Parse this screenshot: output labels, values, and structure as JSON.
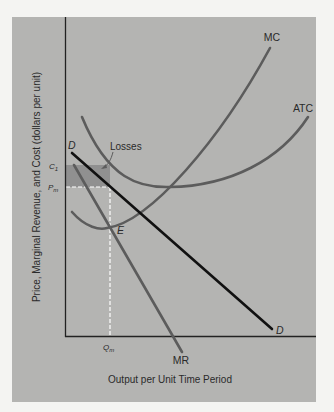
{
  "figure": {
    "y_axis_label": "Price, Marginal Revenue, and Cost (dollars per unit)",
    "x_axis_label": "Output per Unit Time Period",
    "curve_labels": {
      "mc": "MC",
      "atc": "ATC",
      "mr": "MR",
      "demand_top": "D",
      "demand_bottom": "D"
    },
    "point_labels": {
      "equilibrium": "E",
      "quantity": "Q",
      "quantity_sub": "m",
      "price": "P",
      "price_sub": "m",
      "cost": "C",
      "cost_sub": "1"
    },
    "annotation": "Losses",
    "colors": {
      "panel": "#b4b4b2",
      "curve": "#5c5c5c",
      "demand": "#111111",
      "losses_fill": "#909090",
      "guide": "#ffffff",
      "axis": "#222222"
    }
  }
}
